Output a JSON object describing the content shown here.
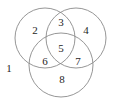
{
  "figure": {
    "name": "three-set-venn-diagram",
    "type": "venn",
    "sets": 3,
    "background_color": "#ffffff",
    "stroke_color": "#8a8a8a",
    "stroke_width": 0.9,
    "label_color": "#262626",
    "circles": [
      {
        "id": "left-circle",
        "cx": 45,
        "cy": 38,
        "r": 30
      },
      {
        "id": "right-circle",
        "cx": 76,
        "cy": 38,
        "r": 30
      },
      {
        "id": "bottom-circle",
        "cx": 61,
        "cy": 65,
        "r": 32
      }
    ],
    "regions": [
      {
        "id": "region-outside",
        "label": "1",
        "x": 9,
        "y": 69,
        "membership": "none"
      },
      {
        "id": "region-left-only",
        "label": "2",
        "x": 35,
        "y": 31,
        "membership": "A"
      },
      {
        "id": "region-left-right",
        "label": "3",
        "x": 61,
        "y": 23,
        "membership": "A,B"
      },
      {
        "id": "region-right-only",
        "label": "4",
        "x": 86,
        "y": 31,
        "membership": "B"
      },
      {
        "id": "region-all-three",
        "label": "5",
        "x": 61,
        "y": 49,
        "membership": "A,B,C"
      },
      {
        "id": "region-left-bottom",
        "label": "6",
        "x": 45,
        "y": 62,
        "membership": "A,C"
      },
      {
        "id": "region-right-bottom",
        "label": "7",
        "x": 78,
        "y": 62,
        "membership": "B,C"
      },
      {
        "id": "region-bottom-only",
        "label": "8",
        "x": 62,
        "y": 80,
        "membership": "C"
      }
    ]
  }
}
